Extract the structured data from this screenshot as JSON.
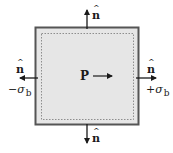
{
  "diagram": {
    "box": {
      "outer_stroke": "#555555",
      "fill": "#e6e6e6",
      "inner_dashed_stroke": "#777777"
    },
    "center_label": "P",
    "normals": {
      "top": {
        "label": "n",
        "hat": "^"
      },
      "bottom": {
        "label": "n",
        "hat": "^"
      },
      "left": {
        "label": "n",
        "hat": "^"
      },
      "right": {
        "label": "n",
        "hat": "^"
      }
    },
    "stresses": {
      "left": {
        "sign": "−",
        "symbol": "σ",
        "subscript": "b"
      },
      "right": {
        "sign": "+",
        "symbol": "σ",
        "subscript": "b"
      }
    },
    "arrow_color": "#1a1a1a"
  }
}
